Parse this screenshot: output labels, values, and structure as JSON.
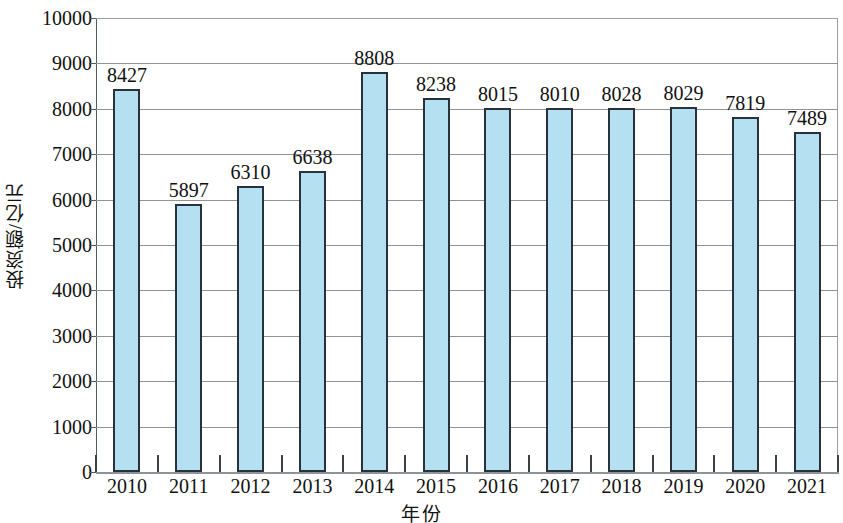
{
  "chart_data": {
    "type": "bar",
    "title": "",
    "xlabel": "年份",
    "ylabel": "投资额/亿元",
    "categories": [
      "2010",
      "2011",
      "2012",
      "2013",
      "2014",
      "2015",
      "2016",
      "2017",
      "2018",
      "2019",
      "2020",
      "2021"
    ],
    "values": [
      8427,
      5897,
      6310,
      6638,
      8808,
      8238,
      8015,
      8010,
      8028,
      8029,
      7819,
      7489
    ],
    "series": [
      {
        "name": "投资额",
        "values": [
          8427,
          5897,
          6310,
          6638,
          8808,
          8238,
          8015,
          8010,
          8028,
          8029,
          7819,
          7489
        ]
      }
    ],
    "ylim": [
      0,
      10000
    ],
    "y_ticks": [
      0,
      1000,
      2000,
      3000,
      4000,
      5000,
      6000,
      7000,
      8000,
      9000,
      10000
    ],
    "y_tick_labels": [
      "0",
      "1000",
      "2000",
      "3000",
      "4000",
      "5000",
      "6000",
      "7000",
      "8000",
      "9000",
      "10000"
    ],
    "grid": true,
    "grid_axis": "y",
    "legend": false,
    "legend_position": "none",
    "data_labels": true,
    "bar_fill_color": "#b4e0f2",
    "bar_border_color": "#28313c",
    "gridline_color": "#8e9497",
    "axis_color": "#55595c",
    "background_color": "#ffffff",
    "text_color": "#111111"
  }
}
